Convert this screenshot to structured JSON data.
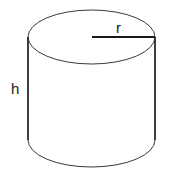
{
  "diagram": {
    "labels": {
      "height": "h",
      "radius": "r"
    },
    "colors": {
      "stroke": "#2a2a2a",
      "background": "#ffffff"
    }
  }
}
